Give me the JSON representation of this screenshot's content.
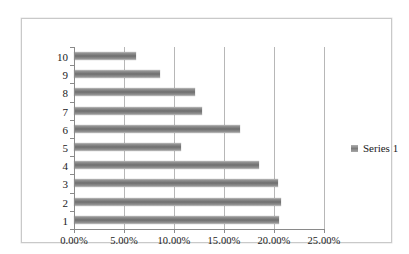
{
  "chart_data": {
    "type": "bar",
    "orientation": "horizontal",
    "title": "",
    "xlabel": "",
    "ylabel": "",
    "categories": [
      "1",
      "2",
      "3",
      "4",
      "5",
      "6",
      "7",
      "8",
      "9",
      "10"
    ],
    "series": [
      {
        "name": "Series 1",
        "values": [
          20.4,
          20.6,
          20.3,
          18.4,
          10.7,
          16.5,
          12.7,
          12.1,
          8.6,
          6.2
        ]
      }
    ],
    "xlim": [
      0,
      25
    ],
    "xticks": [
      0,
      5,
      10,
      15,
      20,
      25
    ],
    "xtick_labels": [
      "0.00%",
      "5.00%",
      "10.00%",
      "15.00%",
      "20.00%",
      "25.00%"
    ],
    "ytick_labels": [
      "10",
      "9",
      "8",
      "7",
      "6",
      "5",
      "4",
      "3",
      "2",
      "1"
    ],
    "grid": "vertical",
    "legend_position": "right",
    "legend_entries": [
      "Series 1"
    ],
    "value_format": "percent",
    "bar_color": "#7a7a7a",
    "gridline_color": "#b7b7b7",
    "axis_color": "#8a8a8a",
    "plot_background": "#ffffff",
    "frame_border_color": "#c9c9c9"
  },
  "legend": {
    "series_1_label": "Series 1"
  }
}
